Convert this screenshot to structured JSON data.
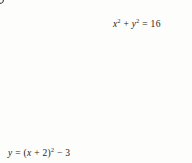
{
  "figure": {
    "name": "region-bounded-by-circle-and-parabola",
    "width": 192,
    "height": 163,
    "background": "#fdfdfc"
  },
  "axes": {
    "x_label": "x",
    "y_label": "y",
    "origin_label": "0",
    "origin_px": [
      78,
      74
    ],
    "unit_px": 18.5,
    "xlim": [
      -4.2,
      6.2
    ],
    "ylim": [
      -4.8,
      4.0
    ],
    "axis_color": "#333333",
    "grid": true,
    "grid_color": "#d8dce0",
    "grid_step": 1
  },
  "tick_labels": [
    {
      "name": "y-tick-3",
      "text": "3",
      "value": 3,
      "axis": "y"
    },
    {
      "name": "y-tick-neg3",
      "text": "−3",
      "value": -3,
      "axis": "y"
    },
    {
      "name": "x-tick-neg2",
      "text": "−2",
      "value": -2,
      "axis": "x"
    }
  ],
  "curves": [
    {
      "name": "circle",
      "type": "circle",
      "equation": "x² + y² = 16",
      "equation_base": "x",
      "radius": 4,
      "center": [
        0,
        0
      ],
      "color": "#1a1a1a",
      "stroke_px": 1.4
    },
    {
      "name": "parabola",
      "type": "parabola",
      "equation": "y = (x + 2)² − 3",
      "vertex": [
        -2,
        -3
      ],
      "a": 1,
      "color": "#1a1a1a",
      "stroke_px": 1.4
    }
  ],
  "labels": {
    "circle_eq": {
      "name": "circle-equation-label",
      "lead": "x",
      "sup1": "2",
      "mid": " + y",
      "sup2": "2",
      "tail": " = 16",
      "text": "x² + y² = 16"
    },
    "parabola_eq": {
      "name": "parabola-equation-label",
      "lead": "y = (x + 2)",
      "sup": "2",
      "tail": " − 3",
      "text": "y = (x + 2)² − 3"
    }
  },
  "shaded_region": {
    "name": "region-between-circle-and-parabola",
    "description": "Region inside the circle and above the parabola",
    "fill": "#dcdcdc",
    "opacity": 0.85
  },
  "intersections": [
    {
      "name": "intersection-left",
      "approx": [
        -3.83,
        1.13
      ]
    },
    {
      "name": "intersection-right",
      "approx": [
        -0.3,
        -0.11
      ]
    }
  ]
}
